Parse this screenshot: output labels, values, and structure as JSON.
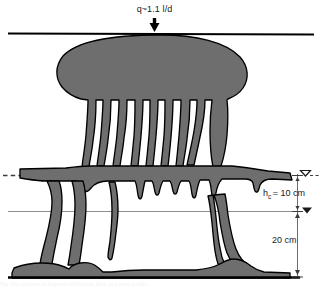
{
  "figure": {
    "type": "scientific-cross-section-diagram",
    "width_px": 322,
    "height_px": 290,
    "background_color": "#ffffff",
    "dye_fill_color": "#6e6e6e",
    "dye_outline_color": "#000000",
    "boundary_line_color": "#000000",
    "reference_line_color": "#8c8c8c",
    "void_color": "#ffffff"
  },
  "annotations": {
    "flux_label": "q~1.1 l/d",
    "flux_arrow_icon": "down-arrow-icon",
    "capillary_head_label_prefix": "h",
    "capillary_head_subscript": "c",
    "capillary_head_value": "= 10 cm",
    "capillary_head_full": "h_c = 10 cm",
    "depth_label": "20 cm",
    "water_table_open_symbol": "▽",
    "water_table_filled_symbol": "▼"
  },
  "features": {
    "top_boundary_name": "soil-surface-line",
    "bottom_boundary_name": "basal-boundary-line",
    "mid_reference_name": "intermediate-reference-line",
    "left_dashed_name": "left-dashed-level-line",
    "upper_pond_name": "upper-saturated-lens",
    "upper_finger_count": 12,
    "mid_band_name": "capillary-fringe-band",
    "lower_finger_count": 4,
    "dimension_bar_upper": "h_c",
    "dimension_bar_lower": "20 cm"
  },
  "caption": {
    "ghost_text": "Fig. Dye pattern of fingered infiltration flow in a sand profile."
  }
}
